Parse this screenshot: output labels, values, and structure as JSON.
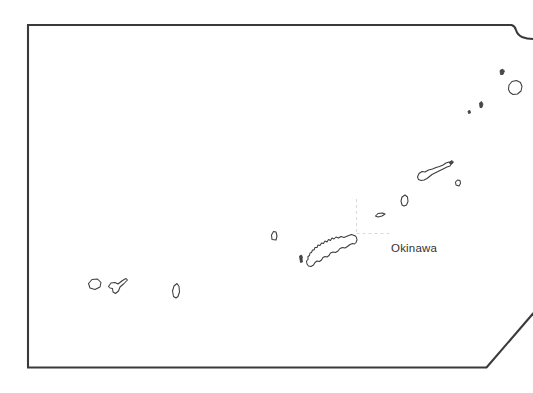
{
  "map": {
    "title": "Okinawa",
    "region_label": "Okinawa",
    "label_position": {
      "x": 391,
      "y": 242
    },
    "canvas": {
      "width": 533,
      "height": 393
    },
    "background_color": "#ffffff",
    "frame_color": "#3a3a3a",
    "coastline_color": "#3c3c3c",
    "graticule_color": "#d9d9d9",
    "label_color": "#333333",
    "frame": {
      "name": "prefecture-boundary",
      "description": "Rectangular prefecture bounding frame with a notch at the top-right and a diagonal cut at the bottom-right",
      "points": "27,24 511,24 516,31 524,35 533,37",
      "points_left_bottom": "27,24 27,368 487,368 533,314"
    },
    "graticule": {
      "vertical": {
        "x": 357,
        "y1": 200,
        "y2": 233
      },
      "horizontal": {
        "y": 233,
        "x1": 357,
        "x2": 391
      }
    },
    "islands": [
      {
        "name": "yonaguni-jima",
        "cx": 94,
        "cy": 284
      },
      {
        "name": "iriomote-ishigaki",
        "cx": 116,
        "cy": 288
      },
      {
        "name": "miyako-jima",
        "cx": 176,
        "cy": 291
      },
      {
        "name": "kume-jima",
        "cx": 274,
        "cy": 236
      },
      {
        "name": "tonaki-jima",
        "cx": 301,
        "cy": 258
      },
      {
        "name": "okinawa-honto",
        "cx": 330,
        "cy": 252
      },
      {
        "name": "iheya-jima",
        "cx": 379,
        "cy": 214
      },
      {
        "name": "okinoerabu-jima",
        "cx": 405,
        "cy": 199
      },
      {
        "name": "amami-oshima",
        "cx": 432,
        "cy": 172
      },
      {
        "name": "kikai-jima",
        "cx": 459,
        "cy": 182
      },
      {
        "name": "tokara-small-1",
        "cx": 470,
        "cy": 112
      },
      {
        "name": "tokara-small-2",
        "cx": 482,
        "cy": 104
      },
      {
        "name": "kuchinoerabu-jima",
        "cx": 503,
        "cy": 72
      },
      {
        "name": "yakushima",
        "cx": 515,
        "cy": 88
      }
    ]
  }
}
